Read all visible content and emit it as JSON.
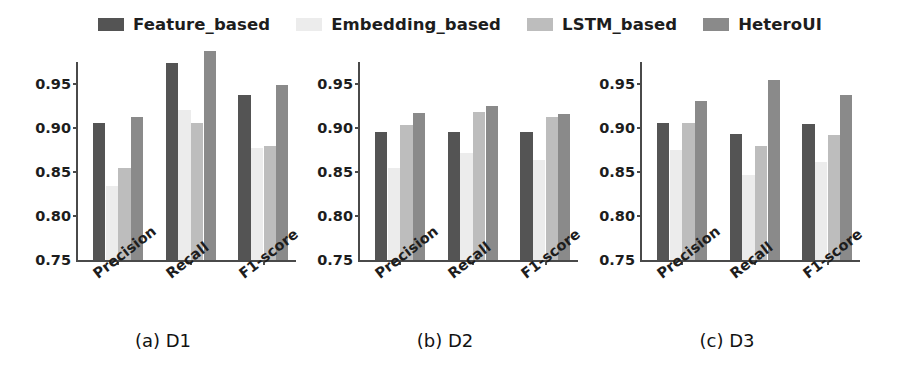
{
  "chart_data": {
    "type": "bar",
    "title": "",
    "xlabel": "",
    "ylabel": "",
    "ylim": [
      0.75,
      0.975
    ],
    "yticks": [
      "0.75",
      "0.80",
      "0.85",
      "0.90",
      "0.95"
    ],
    "ytick_values": [
      0.75,
      0.8,
      0.85,
      0.9,
      0.95
    ],
    "grid": false,
    "legend_position": "top-center",
    "categories": [
      "Precision",
      "Recall",
      "F1-score"
    ],
    "series_names": [
      "Feature_based",
      "Embedding_based",
      "LSTM_based",
      "HeteroUI"
    ],
    "colors": {
      "Feature_based": "#545454",
      "Embedding_based": "#ececec",
      "LSTM_based": "#bdbdbd",
      "HeteroUI": "#8a8a8a"
    },
    "panels": [
      {
        "caption": "(a) D1",
        "categories": [
          "Precision",
          "Recall",
          "F1-score"
        ],
        "series": [
          {
            "name": "Feature_based",
            "values": [
              0.906,
              0.974,
              0.938
            ]
          },
          {
            "name": "Embedding_based",
            "values": [
              0.834,
              0.92,
              0.877
            ]
          },
          {
            "name": "LSTM_based",
            "values": [
              0.855,
              0.906,
              0.88
            ]
          },
          {
            "name": "HeteroUI",
            "values": [
              0.912,
              0.987,
              0.949
            ]
          }
        ]
      },
      {
        "caption": "(b) D2",
        "categories": [
          "Precision",
          "Recall",
          "F1-score"
        ],
        "series": [
          {
            "name": "Feature_based",
            "values": [
              0.896,
              0.896,
              0.895
            ]
          },
          {
            "name": "Embedding_based",
            "values": [
              0.855,
              0.872,
              0.864
            ]
          },
          {
            "name": "LSTM_based",
            "values": [
              0.903,
              0.918,
              0.912
            ]
          },
          {
            "name": "HeteroUI",
            "values": [
              0.917,
              0.925,
              0.916
            ]
          }
        ]
      },
      {
        "caption": "(c) D3",
        "categories": [
          "Precision",
          "Recall",
          "F1-score"
        ],
        "series": [
          {
            "name": "Feature_based",
            "values": [
              0.906,
              0.893,
              0.904
            ]
          },
          {
            "name": "Embedding_based",
            "values": [
              0.875,
              0.847,
              0.861
            ]
          },
          {
            "name": "LSTM_based",
            "values": [
              0.906,
              0.879,
              0.892
            ]
          },
          {
            "name": "HeteroUI",
            "values": [
              0.931,
              0.954,
              0.937
            ]
          }
        ]
      }
    ]
  },
  "legend": {
    "items": [
      {
        "label": "Feature_based",
        "color": "#545454"
      },
      {
        "label": "Embedding_based",
        "color": "#ececec"
      },
      {
        "label": "LSTM_based",
        "color": "#bdbdbd"
      },
      {
        "label": "HeteroUI",
        "color": "#8a8a8a"
      }
    ]
  }
}
